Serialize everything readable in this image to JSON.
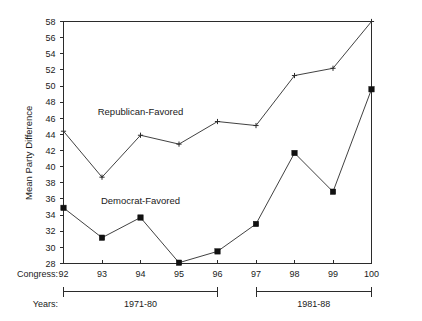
{
  "chart_data": {
    "type": "line",
    "title": "",
    "xlabel": "Congress:",
    "ylabel": "Mean Party Difference",
    "categories": [
      "92",
      "93",
      "94",
      "95",
      "96",
      "97",
      "98",
      "99",
      "100"
    ],
    "ylim": [
      28,
      58
    ],
    "yticks": [
      28,
      30,
      32,
      34,
      36,
      38,
      40,
      42,
      44,
      46,
      48,
      50,
      52,
      54,
      56,
      58
    ],
    "grid": false,
    "legend": "inline-annotations",
    "series": [
      {
        "name": "Republican-Favored",
        "marker": "cross",
        "values": [
          44.4,
          38.7,
          43.9,
          42.8,
          45.6,
          45.1,
          51.3,
          52.2,
          58.0
        ]
      },
      {
        "name": "Democrat-Favored",
        "marker": "filled-square",
        "values": [
          34.9,
          31.2,
          33.7,
          28.1,
          29.5,
          32.9,
          41.7,
          36.9,
          49.6
        ]
      }
    ],
    "annotations": [
      {
        "text": "Republican-Favored",
        "x_category": "94",
        "y_value": 46.4
      },
      {
        "text": "Democrat-Favored",
        "x_category": "94",
        "y_value": 35.4
      }
    ],
    "axis_rows": [
      {
        "label": "Congress:"
      },
      {
        "label": "Years:"
      }
    ],
    "period_brackets": [
      {
        "label": "1971-80",
        "from_category": "92",
        "to_category": "96"
      },
      {
        "label": "1981-88",
        "from_category": "97",
        "to_category": "100"
      }
    ]
  },
  "colors": {
    "axis": "#2b2b2b",
    "line": "#2b2b2b",
    "marker": "#111111",
    "text": "#1a1a1a",
    "background": "#ffffff"
  }
}
